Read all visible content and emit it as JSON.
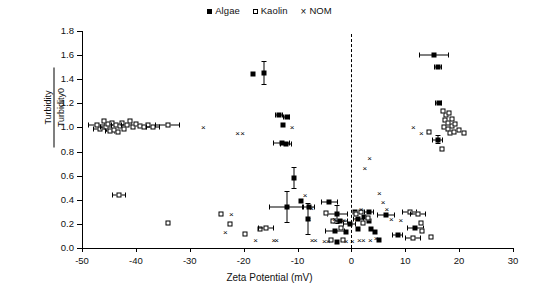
{
  "legend": {
    "entries": [
      {
        "label": "Algae",
        "marker": "filled-square",
        "color": "#000000"
      },
      {
        "label": "Kaolin",
        "marker": "open-square",
        "color": "#000000"
      },
      {
        "label": "NOM",
        "marker": "cross",
        "color": "#000000",
        "glyph": "×"
      }
    ]
  },
  "chart_data": {
    "type": "scatter",
    "title": "",
    "xlabel": "Zeta Potential (mV)",
    "ylabel_numerator": "Turbidity",
    "ylabel_denominator": "Turbidity0",
    "xlim": [
      -50,
      30
    ],
    "ylim": [
      0.0,
      1.8
    ],
    "xticks": [
      -50,
      -40,
      -30,
      -20,
      -10,
      0,
      10,
      20,
      30
    ],
    "xtick_labels": [
      "-50",
      "-40",
      "-30",
      "-20",
      "-10",
      "0",
      "10",
      "20",
      "30"
    ],
    "yticks": [
      0.0,
      0.2,
      0.4,
      0.6,
      0.8,
      1.0,
      1.2,
      1.4,
      1.6,
      1.8
    ],
    "ytick_labels": [
      "0.0",
      "0.2",
      "0.4",
      "0.6",
      "0.8",
      "1.0",
      "1.2",
      "1.4",
      "1.6",
      "1.8"
    ],
    "grid": false,
    "legend_position": "top-center",
    "annotations": [
      {
        "type": "vline",
        "x": 0,
        "style": "dashed",
        "label": "zero-zeta-potential-line"
      }
    ],
    "series": [
      {
        "name": "Algae",
        "marker": "filled-square",
        "points": [
          {
            "x": -18.2,
            "y": 1.44
          },
          {
            "x": -16.3,
            "y": 1.45,
            "yerr": 0.1
          },
          {
            "x": -13.4,
            "y": 1.1,
            "xerr": 0.7
          },
          {
            "x": -12.0,
            "y": 1.09,
            "xerr": 0.7
          },
          {
            "x": -12.6,
            "y": 1.02
          },
          {
            "x": -12.9,
            "y": 0.87,
            "xerr": 1.6
          },
          {
            "x": -12.1,
            "y": 0.86,
            "xerr": 1.1
          },
          {
            "x": -10.6,
            "y": 0.58,
            "yerr": 0.09
          },
          {
            "x": -12.0,
            "y": 0.34,
            "xerr": 3.2,
            "yerr": 0.13
          },
          {
            "x": -9.3,
            "y": 0.39
          },
          {
            "x": -7.9,
            "y": 0.34,
            "xerr": 1.2
          },
          {
            "x": -8.1,
            "y": 0.24,
            "yerr": 0.13
          },
          {
            "x": -4.1,
            "y": 0.38,
            "xerr": 1.6
          },
          {
            "x": -2.6,
            "y": 0.28,
            "xerr": 2.0,
            "yerr": 0.08
          },
          {
            "x": -2.1,
            "y": 0.22,
            "xerr": 1.4
          },
          {
            "x": -3.0,
            "y": 0.14,
            "xerr": 1.9
          },
          {
            "x": -1.0,
            "y": 0.13
          },
          {
            "x": -0.3,
            "y": 0.2,
            "xerr": 1.2
          },
          {
            "x": 0.6,
            "y": 0.3
          },
          {
            "x": 1.3,
            "y": 0.24,
            "xerr": 1.0
          },
          {
            "x": 1.2,
            "y": 0.16
          },
          {
            "x": 2.4,
            "y": 0.26
          },
          {
            "x": 3.3,
            "y": 0.3,
            "xerr": 0.9
          },
          {
            "x": 3.2,
            "y": 0.22
          },
          {
            "x": 3.6,
            "y": 0.16
          },
          {
            "x": 4.3,
            "y": 0.13
          },
          {
            "x": 6.4,
            "y": 0.27,
            "xerr": 1.7
          },
          {
            "x": 8.6,
            "y": 0.11,
            "xerr": 1.0
          },
          {
            "x": 11.9,
            "y": 0.17,
            "xerr": 1.6
          },
          {
            "x": 15.4,
            "y": 1.6,
            "xerr": 2.8
          },
          {
            "x": 16.1,
            "y": 1.5,
            "xerr": 0.8
          },
          {
            "x": 16.2,
            "y": 1.2,
            "xerr": 0.7
          },
          {
            "x": 16.0,
            "y": 0.9,
            "xerr": 1.0,
            "yerr": 0.04
          },
          {
            "x": -2.6,
            "y": 0.05
          },
          {
            "x": 5.1,
            "y": 0.07
          }
        ]
      },
      {
        "name": "Kaolin",
        "marker": "open-square",
        "points": [
          {
            "x": -47.3,
            "y": 1.02,
            "xerr": 1.6
          },
          {
            "x": -46.6,
            "y": 0.99,
            "xerr": 1.3
          },
          {
            "x": -46.0,
            "y": 1.05
          },
          {
            "x": -45.6,
            "y": 1.0,
            "xerr": 1.1
          },
          {
            "x": -45.1,
            "y": 1.03
          },
          {
            "x": -44.8,
            "y": 0.97,
            "xerr": 1.0
          },
          {
            "x": -44.4,
            "y": 1.04
          },
          {
            "x": -44.1,
            "y": 0.98
          },
          {
            "x": -43.7,
            "y": 1.02,
            "xerr": 0.9
          },
          {
            "x": -43.4,
            "y": 0.96
          },
          {
            "x": -43.0,
            "y": 1.01
          },
          {
            "x": -42.6,
            "y": 1.04
          },
          {
            "x": -42.2,
            "y": 0.99
          },
          {
            "x": -41.7,
            "y": 1.02,
            "xerr": 1.0
          },
          {
            "x": -41.1,
            "y": 1.05
          },
          {
            "x": -40.6,
            "y": 1.0
          },
          {
            "x": -40.0,
            "y": 1.03
          },
          {
            "x": -39.3,
            "y": 1.01
          },
          {
            "x": -38.5,
            "y": 1.0
          },
          {
            "x": -37.7,
            "y": 1.02
          },
          {
            "x": -36.8,
            "y": 1.0,
            "xerr": 1.3
          },
          {
            "x": -34.1,
            "y": 1.02,
            "xerr": 2.3
          },
          {
            "x": -43.1,
            "y": 0.44,
            "xerr": 1.3
          },
          {
            "x": -34.0,
            "y": 0.21
          },
          {
            "x": -24.2,
            "y": 0.28
          },
          {
            "x": -22.6,
            "y": 0.2
          },
          {
            "x": -19.7,
            "y": 0.12
          },
          {
            "x": -16.9,
            "y": 0.16
          },
          {
            "x": -15.9,
            "y": 0.17,
            "xerr": 1.5
          },
          {
            "x": -4.8,
            "y": 0.29
          },
          {
            "x": -3.5,
            "y": 0.22
          },
          {
            "x": -2.0,
            "y": 0.17
          },
          {
            "x": -3.8,
            "y": 0.07
          },
          {
            "x": -1.6,
            "y": 0.07
          },
          {
            "x": 0.9,
            "y": 0.28
          },
          {
            "x": 1.7,
            "y": 0.3
          },
          {
            "x": 2.1,
            "y": 0.21
          },
          {
            "x": 3.1,
            "y": 0.25
          },
          {
            "x": 10.8,
            "y": 0.3,
            "xerr": 1.4
          },
          {
            "x": 12.4,
            "y": 0.28,
            "xerr": 1.5
          },
          {
            "x": 11.4,
            "y": 0.08,
            "xerr": 1.5
          },
          {
            "x": 12.9,
            "y": 0.21
          },
          {
            "x": 13.1,
            "y": 0.14
          },
          {
            "x": 14.4,
            "y": 0.96
          },
          {
            "x": 17.0,
            "y": 1.14
          },
          {
            "x": 17.6,
            "y": 1.1
          },
          {
            "x": 18.1,
            "y": 1.12
          },
          {
            "x": 17.3,
            "y": 1.06
          },
          {
            "x": 18.0,
            "y": 1.04
          },
          {
            "x": 18.7,
            "y": 1.07
          },
          {
            "x": 17.2,
            "y": 1.0
          },
          {
            "x": 17.9,
            "y": 0.99
          },
          {
            "x": 18.6,
            "y": 1.01
          },
          {
            "x": 19.3,
            "y": 1.03
          },
          {
            "x": 18.3,
            "y": 0.95
          },
          {
            "x": 19.1,
            "y": 0.96
          },
          {
            "x": 20.0,
            "y": 0.98
          },
          {
            "x": 20.9,
            "y": 0.95
          },
          {
            "x": 16.8,
            "y": 0.82
          },
          {
            "x": 14.7,
            "y": 0.09
          }
        ]
      },
      {
        "name": "NOM",
        "marker": "cross",
        "glyph": "×",
        "points": [
          {
            "x": -27.5,
            "y": 1.0
          },
          {
            "x": -21.1,
            "y": 0.95
          },
          {
            "x": -20.2,
            "y": 0.95
          },
          {
            "x": -11.0,
            "y": 1.0
          },
          {
            "x": -22.3,
            "y": 0.28
          },
          {
            "x": -23.4,
            "y": 0.13
          },
          {
            "x": -17.8,
            "y": 0.07
          },
          {
            "x": -14.4,
            "y": 0.07
          },
          {
            "x": -13.9,
            "y": 0.07
          },
          {
            "x": -8.6,
            "y": 0.44
          },
          {
            "x": -7.4,
            "y": 0.33
          },
          {
            "x": -7.9,
            "y": 0.24
          },
          {
            "x": -7.3,
            "y": 0.07
          },
          {
            "x": -6.7,
            "y": 0.07
          },
          {
            "x": -5.0,
            "y": 0.06
          },
          {
            "x": -4.3,
            "y": 0.06
          },
          {
            "x": -3.1,
            "y": 0.24
          },
          {
            "x": -1.4,
            "y": 0.23
          },
          {
            "x": -1.0,
            "y": 0.06
          },
          {
            "x": 0.2,
            "y": 0.06
          },
          {
            "x": 1.0,
            "y": 0.24
          },
          {
            "x": 1.8,
            "y": 0.32
          },
          {
            "x": 1.5,
            "y": 0.07
          },
          {
            "x": 2.2,
            "y": 0.07
          },
          {
            "x": 3.5,
            "y": 0.07
          },
          {
            "x": 4.6,
            "y": 0.08
          },
          {
            "x": 2.5,
            "y": 0.66
          },
          {
            "x": 3.4,
            "y": 0.75
          },
          {
            "x": 5.2,
            "y": 0.46
          },
          {
            "x": 5.9,
            "y": 0.38
          },
          {
            "x": 6.6,
            "y": 0.32
          },
          {
            "x": 7.4,
            "y": 0.24
          },
          {
            "x": 9.2,
            "y": 0.23
          },
          {
            "x": 11.5,
            "y": 1.0
          },
          {
            "x": 13.0,
            "y": 0.95
          }
        ]
      }
    ]
  }
}
